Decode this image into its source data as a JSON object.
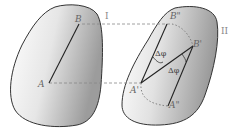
{
  "figure": {
    "type": "rigid-body-plane-motion",
    "body_left": {
      "label": "I",
      "points": {
        "a": "A",
        "b": "B"
      }
    },
    "body_right": {
      "label": "II",
      "points": {
        "a1": "A'",
        "b1": "B'",
        "a2": "A\"",
        "b2": "B\""
      },
      "angle_top": "Δφ",
      "angle_bottom": "Δφ"
    },
    "colors": {
      "outline": "#333333",
      "fill_light": "#ffffff",
      "fill_dark": "#a8a8a8",
      "dashed": "#888888",
      "label": "#666666"
    }
  }
}
